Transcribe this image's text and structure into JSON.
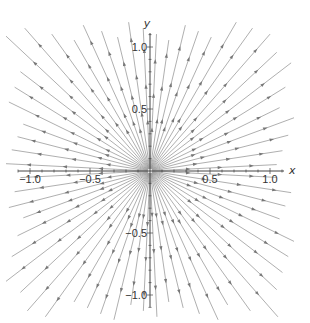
{
  "chart_data": {
    "type": "stream",
    "title": "",
    "xlabel": "x",
    "ylabel": "y",
    "xlim": [
      -1.2,
      1.2
    ],
    "ylim": [
      -1.2,
      1.2
    ],
    "x_ticks": [
      -1.0,
      -0.5,
      0.5,
      1.0
    ],
    "y_ticks": [
      -1.0,
      -0.5,
      0.5,
      1.0
    ],
    "x_tick_labels": [
      "-1.0",
      "-0.5",
      "0.5",
      "1.0"
    ],
    "y_tick_labels": [
      "-1.0",
      "-0.5",
      "0.5",
      "1.0"
    ],
    "field": "(x, y)",
    "num_streamlines": 64,
    "grid": false,
    "legend": null,
    "line_color": "#9a9a9a",
    "arrow_color": "#777777",
    "axis_color": "#444444"
  },
  "axes": {
    "x_label": "x",
    "y_label": "y"
  }
}
